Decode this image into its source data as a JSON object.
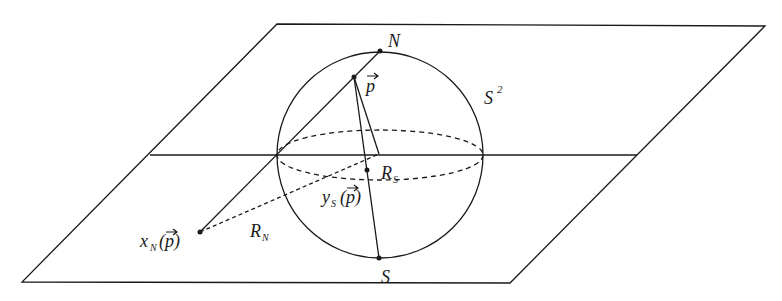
{
  "diagram": {
    "type": "stereographic-projection",
    "colors": {
      "stroke": "#1a1a1a",
      "background": "#ffffff"
    },
    "labels": {
      "north": "N",
      "south": "S",
      "sphere": "S",
      "sphere_sup": "2",
      "point": "p",
      "region_south": "R",
      "region_south_sub": "S",
      "region_north": "R",
      "region_north_sub": "N",
      "proj_north": "x",
      "proj_north_sub": "N",
      "proj_north_arg": "(p)",
      "proj_south": "y",
      "proj_south_sub": "S",
      "proj_south_arg": "(p)"
    }
  }
}
